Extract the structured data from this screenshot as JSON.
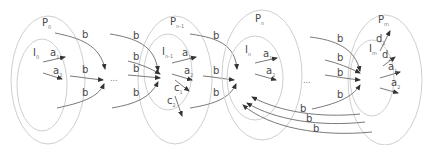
{
  "regions": [
    {
      "id": "p0",
      "outer": {
        "name": "P",
        "sub": "0"
      },
      "inner": {
        "name": "I",
        "sub": "0"
      }
    },
    {
      "id": "pn-1",
      "outer": {
        "name": "P",
        "sub": "n-1"
      },
      "inner": {
        "name": "I",
        "sub": "n-1"
      }
    },
    {
      "id": "pn",
      "outer": {
        "name": "P",
        "sub": "n"
      },
      "inner": {
        "name": "I",
        "sub": "n"
      }
    },
    {
      "id": "pm",
      "outer": {
        "name": "P",
        "sub": "m"
      },
      "inner": {
        "name": "I",
        "sub": "m"
      }
    }
  ],
  "edge_labels": {
    "b": "b",
    "a1": {
      "name": "a",
      "sub": "1"
    },
    "a2": {
      "name": "a",
      "sub": "2"
    },
    "c1": {
      "name": "c",
      "sub": "1"
    },
    "c2": {
      "name": "c",
      "sub": "2"
    },
    "d1": {
      "name": "d",
      "sub": "1"
    },
    "d2": {
      "name": "d",
      "sub": "2"
    }
  },
  "ellipsis": "..."
}
